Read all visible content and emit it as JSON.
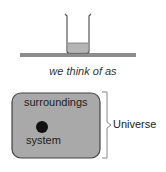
{
  "diagram": {
    "top_caption": "we think of as",
    "box": {
      "surroundings_label": "surroundings",
      "system_label": "system"
    },
    "bracket_label": "Universe",
    "colors": {
      "box_fill": "#a9a9a9",
      "box_border": "#444444",
      "bench": "#8c8c8c",
      "liquid": "#b5b5b5",
      "system_dot": "#111111",
      "bracket": "#888888"
    }
  }
}
